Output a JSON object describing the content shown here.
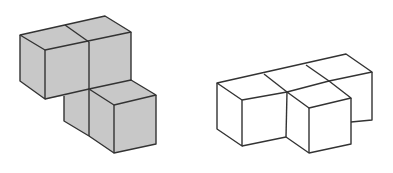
{
  "figures": [
    {
      "name": "shaded-cube-structure",
      "cube_count": 4,
      "fill": "#c8c8c8",
      "stroke": "#333333"
    },
    {
      "name": "unshaded-cube-structure",
      "cube_count": 4,
      "fill": "#ffffff",
      "stroke": "#333333"
    }
  ]
}
